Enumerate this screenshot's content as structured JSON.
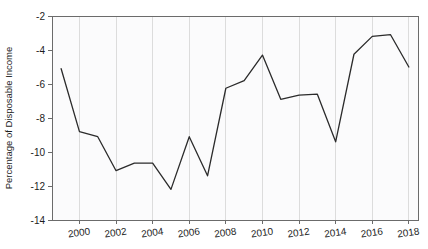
{
  "chart_data": {
    "type": "line",
    "title": "",
    "subtitle": "",
    "xlabel": "",
    "ylabel": "Percentage of Disposable Income",
    "xlim": [
      1998.5,
      2018.5
    ],
    "ylim": [
      -14,
      -2
    ],
    "grid": "vertical-only",
    "legend": "none",
    "series_color": "#2b2b2b",
    "x": [
      1999,
      2000,
      2001,
      2002,
      2003,
      2004,
      2005,
      2006,
      2007,
      2008,
      2009,
      2010,
      2011,
      2012,
      2013,
      2014,
      2015,
      2016,
      2017,
      2018
    ],
    "values": [
      -5.1,
      -8.8,
      -9.1,
      -11.1,
      -10.65,
      -10.65,
      -12.2,
      -9.1,
      -11.4,
      -6.25,
      -5.8,
      -4.3,
      -6.9,
      -6.65,
      -6.6,
      -9.4,
      -4.25,
      -3.2,
      -3.1,
      -5.0
    ],
    "series": [
      {
        "name": "Percentage of Disposable Income",
        "values": [
          -5.1,
          -8.8,
          -9.1,
          -11.1,
          -10.65,
          -10.65,
          -12.2,
          -9.1,
          -11.4,
          -6.25,
          -5.8,
          -4.3,
          -6.9,
          -6.65,
          -6.6,
          -9.4,
          -4.25,
          -3.2,
          -3.1,
          -5.0
        ]
      }
    ],
    "ytick_labels": [
      "-2",
      "-4",
      "-6",
      "-8",
      "-10",
      "-12",
      "-14"
    ],
    "ytick_values": [
      -2,
      -4,
      -6,
      -8,
      -10,
      -12,
      -14
    ],
    "xtick_labels": [
      "2000",
      "2002",
      "2004",
      "2006",
      "2008",
      "2010",
      "2012",
      "2014",
      "2016",
      "2018"
    ],
    "xtick_values": [
      2000,
      2002,
      2004,
      2006,
      2008,
      2010,
      2012,
      2014,
      2016,
      2018
    ],
    "gridline_values": [
      2000,
      2002,
      2004,
      2006,
      2008,
      2010,
      2012,
      2014,
      2016,
      2018
    ]
  }
}
